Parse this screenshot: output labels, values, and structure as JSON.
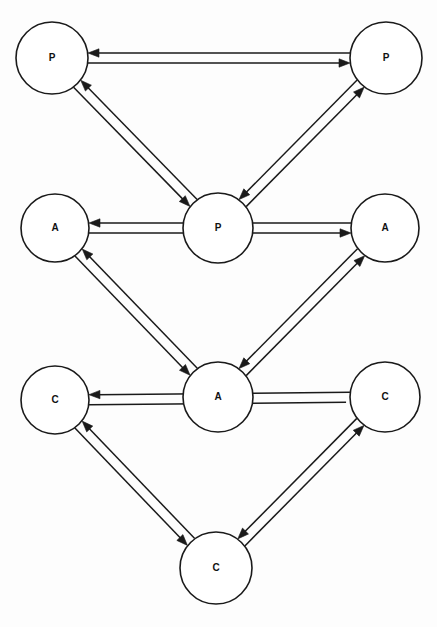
{
  "diagram": {
    "background_color": "#fdfdfd",
    "stroke_color": "#1a1a1a",
    "node_fill_color": "#ffffff",
    "tiers": [
      {
        "id": "tier-p",
        "label": "P"
      },
      {
        "id": "tier-a",
        "label": "A"
      },
      {
        "id": "tier-c",
        "label": "C"
      }
    ],
    "nodes": [
      {
        "id": "p-left",
        "label": "P",
        "cx": 52,
        "cy": 58,
        "r": 36,
        "tier": "P",
        "position": "top-left"
      },
      {
        "id": "p-right",
        "label": "P",
        "cx": 386,
        "cy": 58,
        "r": 36,
        "tier": "P",
        "position": "top-right"
      },
      {
        "id": "p-center",
        "label": "P",
        "cx": 218,
        "cy": 228,
        "r": 35,
        "tier": "P",
        "position": "middle-center"
      },
      {
        "id": "a-left",
        "label": "A",
        "cx": 55,
        "cy": 228,
        "r": 34,
        "tier": "A",
        "position": "middle-left"
      },
      {
        "id": "a-right",
        "label": "A",
        "cx": 385,
        "cy": 228,
        "r": 34,
        "tier": "A",
        "position": "middle-right"
      },
      {
        "id": "a-center",
        "label": "A",
        "cx": 218,
        "cy": 397,
        "r": 35,
        "tier": "A",
        "position": "lower-center"
      },
      {
        "id": "c-left",
        "label": "C",
        "cx": 55,
        "cy": 400,
        "r": 34,
        "tier": "C",
        "position": "lower-left"
      },
      {
        "id": "c-right",
        "label": "C",
        "cx": 385,
        "cy": 397,
        "r": 35,
        "tier": "C",
        "position": "lower-right"
      },
      {
        "id": "c-bottom",
        "label": "C",
        "cx": 216,
        "cy": 568,
        "r": 36,
        "tier": "C",
        "position": "bottom-center"
      }
    ],
    "edges": [
      {
        "id": "edge-pleft-to-pright",
        "from": "p-left",
        "to": "p-right",
        "arrow": "end",
        "kind": "horizontal"
      },
      {
        "id": "edge-pright-to-pleft",
        "from": "p-right",
        "to": "p-left",
        "arrow": "end",
        "kind": "horizontal"
      },
      {
        "id": "edge-pleft-to-pcenter",
        "from": "p-left",
        "to": "p-center",
        "arrow": "end",
        "kind": "diagonal"
      },
      {
        "id": "edge-pcenter-to-pleft",
        "from": "p-center",
        "to": "p-left",
        "arrow": "end",
        "kind": "diagonal"
      },
      {
        "id": "edge-pcenter-to-pright",
        "from": "p-center",
        "to": "p-right",
        "arrow": "end",
        "kind": "diagonal"
      },
      {
        "id": "edge-pright-to-pcenter",
        "from": "p-right",
        "to": "p-center",
        "arrow": "end",
        "kind": "diagonal"
      },
      {
        "id": "edge-aleft-to-aright",
        "from": "a-left",
        "to": "a-right",
        "arrow": "end",
        "kind": "horizontal"
      },
      {
        "id": "edge-aright-to-aleft",
        "from": "a-right",
        "to": "a-left",
        "arrow": "end",
        "kind": "horizontal"
      },
      {
        "id": "edge-aleft-to-acenter",
        "from": "a-left",
        "to": "a-center",
        "arrow": "end",
        "kind": "diagonal"
      },
      {
        "id": "edge-acenter-to-aleft",
        "from": "a-center",
        "to": "a-left",
        "arrow": "end",
        "kind": "diagonal"
      },
      {
        "id": "edge-acenter-to-aright",
        "from": "a-center",
        "to": "a-right",
        "arrow": "end",
        "kind": "diagonal"
      },
      {
        "id": "edge-aright-to-acenter",
        "from": "a-right",
        "to": "a-center",
        "arrow": "end",
        "kind": "diagonal"
      },
      {
        "id": "edge-cleft-to-cright",
        "from": "c-left",
        "to": "c-right",
        "arrow": "none",
        "kind": "horizontal"
      },
      {
        "id": "edge-cright-to-cleft",
        "from": "c-right",
        "to": "c-left",
        "arrow": "end",
        "kind": "horizontal"
      },
      {
        "id": "edge-cleft-to-cbottom",
        "from": "c-left",
        "to": "c-bottom",
        "arrow": "end",
        "kind": "diagonal"
      },
      {
        "id": "edge-cbottom-to-cleft",
        "from": "c-bottom",
        "to": "c-left",
        "arrow": "end",
        "kind": "diagonal"
      },
      {
        "id": "edge-cbottom-to-cright",
        "from": "c-bottom",
        "to": "c-right",
        "arrow": "end",
        "kind": "diagonal"
      },
      {
        "id": "edge-cright-to-cbottom",
        "from": "c-right",
        "to": "c-bottom",
        "arrow": "end",
        "kind": "diagonal"
      }
    ],
    "geometry": {
      "lane_offset": 10,
      "arrow_length": 11,
      "arrow_width": 4.2,
      "stroke_width": 1.5
    }
  }
}
